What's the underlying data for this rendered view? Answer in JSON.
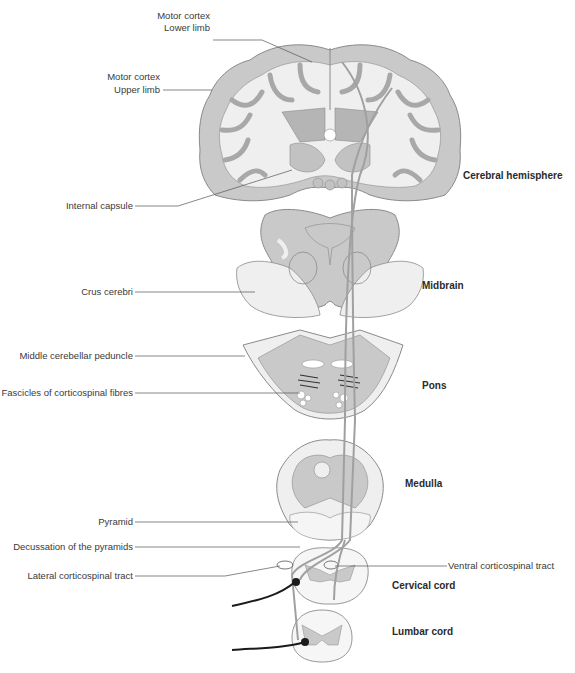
{
  "diagram": {
    "colors": {
      "grey_matter": "#c9c9c9",
      "white_matter": "#efefef",
      "outline": "#8a8a8a",
      "tract": "#a0a0a0",
      "neuron": "#1a1a1a",
      "label_text": "#3a3a3a",
      "leader_line": "#555555"
    },
    "section_labels": {
      "cerebral_hemisphere": "Cerebral hemisphere",
      "midbrain": "Midbrain",
      "pons": "Pons",
      "medulla": "Medulla",
      "cervical_cord": "Cervical cord",
      "lumbar_cord": "Lumbar cord"
    },
    "labels": {
      "motor_cortex_lower_1": "Motor cortex",
      "motor_cortex_lower_2": "Lower limb",
      "motor_cortex_upper_1": "Motor cortex",
      "motor_cortex_upper_2": "Upper limb",
      "internal_capsule": "Internal capsule",
      "crus_cerebri": "Crus cerebri",
      "middle_cerebellar_peduncle": "Middle cerebellar peduncle",
      "fascicles": "Fascicles of corticospinal fibres",
      "pyramid": "Pyramid",
      "decussation": "Decussation of the pyramids",
      "lateral_tract": "Lateral corticospinal tract",
      "ventral_tract": "Ventral corticospinal tract"
    }
  }
}
